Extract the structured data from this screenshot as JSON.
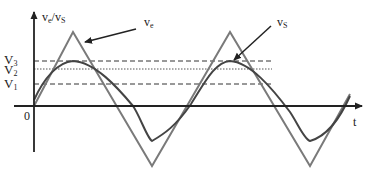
{
  "diagram": {
    "y_axis_label": "v",
    "y_axis_label_sub1": "e",
    "y_axis_label_sep": "/v",
    "y_axis_label_sub2": "S",
    "x_axis_label": "t",
    "origin_label": "0",
    "levels": [
      {
        "name": "V",
        "sub": "3",
        "style": "dashed"
      },
      {
        "name": "V",
        "sub": "2",
        "style": "dotted"
      },
      {
        "name": "V",
        "sub": "1",
        "style": "dashed"
      }
    ],
    "callouts": [
      {
        "text": "v",
        "sub": "e",
        "target": "triangle-wave"
      },
      {
        "text": "v",
        "sub": "S",
        "target": "sine-wave"
      }
    ],
    "colors": {
      "axis": "#222222",
      "triangle_wave": "#7a7a7a",
      "sine_wave": "#444444",
      "reference_lines": "#333333"
    }
  }
}
